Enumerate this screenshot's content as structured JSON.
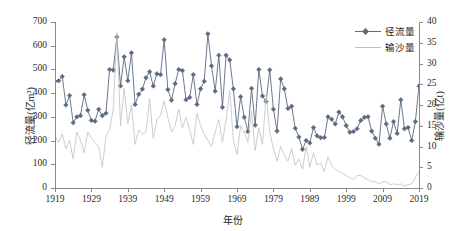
{
  "chart_data": {
    "type": "line",
    "title": "",
    "xlabel": "年份",
    "ylabel": "径流量(亿m³)",
    "y2label": "输沙量(亿t)",
    "xlim": [
      1919,
      2019
    ],
    "ylim": [
      0,
      700
    ],
    "y2lim": [
      0,
      40
    ],
    "grid": false,
    "legend_position": "top-right",
    "x_ticks": [
      1919,
      1929,
      1939,
      1949,
      1959,
      1969,
      1979,
      1989,
      1999,
      2009,
      2019
    ],
    "y_ticks": [
      0,
      100,
      200,
      300,
      400,
      500,
      600,
      700
    ],
    "y2_ticks": [
      0,
      5,
      10,
      15,
      20,
      25,
      30,
      35,
      40
    ],
    "x": [
      1919,
      1920,
      1921,
      1922,
      1923,
      1924,
      1925,
      1926,
      1927,
      1928,
      1929,
      1930,
      1931,
      1932,
      1933,
      1934,
      1935,
      1936,
      1937,
      1938,
      1939,
      1940,
      1941,
      1942,
      1943,
      1944,
      1945,
      1946,
      1947,
      1948,
      1949,
      1950,
      1951,
      1952,
      1953,
      1954,
      1955,
      1956,
      1957,
      1958,
      1959,
      1960,
      1961,
      1962,
      1963,
      1964,
      1965,
      1966,
      1967,
      1968,
      1969,
      1970,
      1971,
      1972,
      1973,
      1974,
      1975,
      1976,
      1977,
      1978,
      1979,
      1980,
      1981,
      1982,
      1983,
      1984,
      1985,
      1986,
      1987,
      1988,
      1989,
      1990,
      1991,
      1992,
      1993,
      1994,
      1995,
      1996,
      1997,
      1998,
      1999,
      2000,
      2001,
      2002,
      2003,
      2004,
      2005,
      2006,
      2007,
      2008,
      2009,
      2010,
      2011,
      2012,
      2013,
      2014,
      2015,
      2016,
      2017,
      2018,
      2019
    ],
    "series": [
      {
        "name": "径流量",
        "axis": "left",
        "unit": "亿m³",
        "color": "#5a6b80",
        "marker": "diamond",
        "values": [
          450,
          452,
          470,
          350,
          390,
          275,
          300,
          305,
          393,
          328,
          285,
          282,
          332,
          305,
          315,
          500,
          497,
          637,
          430,
          553,
          452,
          570,
          352,
          395,
          417,
          465,
          490,
          430,
          482,
          478,
          625,
          415,
          370,
          440,
          500,
          495,
          372,
          382,
          478,
          352,
          418,
          450,
          650,
          515,
          408,
          560,
          340,
          560,
          540,
          418,
          258,
          385,
          298,
          238,
          420,
          265,
          500,
          388,
          365,
          498,
          332,
          240,
          460,
          418,
          335,
          345,
          252,
          215,
          163,
          200,
          190,
          255,
          220,
          212,
          213,
          300,
          290,
          270,
          320,
          300,
          263,
          235,
          238,
          250,
          285,
          298,
          300,
          240,
          210,
          185,
          345,
          270,
          210,
          280,
          230,
          372,
          250,
          255,
          200,
          280,
          430
        ]
      },
      {
        "name": "输沙量",
        "axis": "right",
        "unit": "亿t",
        "color": "#c0c0c0",
        "marker": "none",
        "values": [
          12.5,
          11.0,
          13.0,
          9.5,
          11.5,
          7.0,
          13.5,
          11.5,
          8.5,
          13.5,
          12.0,
          11.0,
          10.0,
          5.0,
          12.5,
          14.0,
          19.0,
          37.5,
          15.0,
          24.0,
          15.5,
          20.0,
          10.5,
          14.0,
          13.0,
          13.5,
          21.5,
          12.0,
          16.5,
          17.5,
          21.0,
          17.0,
          13.5,
          15.0,
          19.0,
          14.5,
          17.0,
          14.0,
          10.5,
          18.0,
          15.0,
          13.0,
          11.5,
          10.0,
          13.5,
          16.5,
          11.0,
          16.5,
          23.5,
          11.5,
          8.0,
          15.0,
          13.5,
          11.0,
          18.5,
          9.0,
          14.5,
          10.5,
          22.5,
          13.5,
          9.5,
          6.5,
          10.0,
          8.0,
          6.5,
          9.5,
          5.5,
          7.0,
          4.5,
          10.0,
          5.0,
          8.5,
          5.5,
          6.0,
          4.0,
          7.5,
          5.5,
          4.5,
          4.0,
          3.5,
          3.0,
          2.5,
          2.0,
          3.0,
          3.0,
          2.5,
          2.0,
          1.5,
          1.5,
          1.0,
          1.5,
          1.5,
          0.8,
          1.0,
          0.8,
          1.0,
          0.5,
          0.8,
          1.0,
          2.5,
          4.0
        ]
      }
    ]
  },
  "legend": {
    "items": [
      {
        "label": "径流量",
        "marker": "diamond",
        "color": "#5a6b80"
      },
      {
        "label": "输沙量",
        "marker": "none",
        "color": "#c0c0c0"
      }
    ]
  },
  "axes": {
    "x_title": "年份",
    "y_left_title": "径流量(亿m³)",
    "y_right_title": "输沙量(亿t)"
  },
  "colors": {
    "runoff": "#5a6b80",
    "sediment": "#c0c0c0",
    "axis": "#8a8a8a",
    "text": "#1c1c1c",
    "background": "#ffffff"
  }
}
